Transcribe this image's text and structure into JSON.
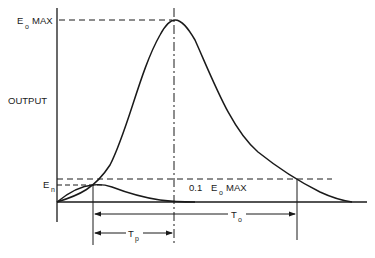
{
  "diagram": {
    "labels": {
      "eo_max": {
        "main": "E",
        "sub": "o",
        "suffix": "MAX"
      },
      "output": "OUTPUT",
      "en": {
        "main": "E",
        "sub": "n"
      },
      "tenth_eo_max": {
        "prefix": "0.1",
        "main": "E",
        "sub": "o",
        "suffix": "MAX"
      },
      "to": {
        "main": "T",
        "sub": "o"
      },
      "tp": {
        "main": "T",
        "sub": "p"
      }
    },
    "curves": [
      {
        "name": "output-pulse",
        "description": "large pulse rising from origin to E_o MAX then decaying"
      },
      {
        "name": "noise-pulse",
        "description": "small pulse peaking at E_n then decaying"
      }
    ],
    "reference_lines": [
      {
        "name": "eo-max-level",
        "style": "dashed"
      },
      {
        "name": "tenth-eo-max-level",
        "style": "dashed"
      },
      {
        "name": "en-level",
        "style": "dashed"
      },
      {
        "name": "peak-time",
        "style": "dash-dot"
      }
    ],
    "colors": {
      "stroke": "#1a1a1a",
      "background": "#ffffff"
    }
  }
}
